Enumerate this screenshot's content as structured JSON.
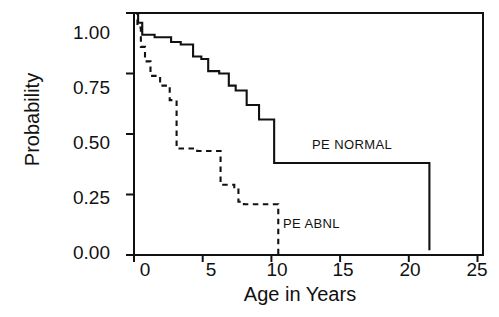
{
  "chart_data": {
    "type": "line",
    "title": "",
    "xlabel": "Age in Years",
    "ylabel": "Probability",
    "xlim": [
      0,
      25.4
    ],
    "ylim": [
      0,
      1.0
    ],
    "xticks": [
      0,
      5,
      10,
      15,
      20,
      25
    ],
    "xtick_labels": [
      "0",
      "5",
      "10",
      "15",
      "20",
      "25"
    ],
    "yticks": [
      0.0,
      0.25,
      0.5,
      0.75,
      1.0
    ],
    "ytick_labels": [
      "0.00",
      "0.25",
      "0.50",
      "0.75",
      "1.00"
    ],
    "grid": false,
    "legend_position": "inline-annotation",
    "step_type": "post",
    "series": [
      {
        "name": "PE NORMAL",
        "style": "solid",
        "color": "#111111",
        "annotation": "PE NORMAL",
        "annotation_x": 13.3,
        "annotation_y": 0.44,
        "x": [
          0.0,
          0.3,
          0.6,
          1.5,
          2.7,
          3.4,
          4.3,
          4.9,
          5.4,
          6.2,
          6.9,
          7.4,
          8.2,
          9.1,
          10.2,
          17.5,
          21.5,
          21.5
        ],
        "y": [
          1.0,
          0.96,
          0.91,
          0.9,
          0.88,
          0.87,
          0.82,
          0.81,
          0.76,
          0.75,
          0.7,
          0.68,
          0.62,
          0.56,
          0.38,
          0.38,
          0.25,
          0.02
        ]
      },
      {
        "name": "PE ABNL",
        "style": "dashed",
        "color": "#111111",
        "annotation": "PE ABNL",
        "annotation_x": 11.2,
        "annotation_y": 0.1,
        "x": [
          0.0,
          0.25,
          0.5,
          0.8,
          1.2,
          1.9,
          2.6,
          3.1,
          3.1,
          4.6,
          6.3,
          6.3,
          7.3,
          7.6,
          8.0,
          10.3,
          10.5
        ],
        "y": [
          1.0,
          0.94,
          0.86,
          0.8,
          0.74,
          0.7,
          0.64,
          0.64,
          0.44,
          0.43,
          0.43,
          0.29,
          0.28,
          0.22,
          0.21,
          0.21,
          0.0
        ]
      }
    ]
  },
  "axes": {
    "xaxis_title": "Age in Years",
    "yaxis_title": "Probability",
    "xtick_labels": [
      "0",
      "5",
      "10",
      "15",
      "20",
      "25"
    ],
    "ytick_labels": [
      "1.00",
      "0.75",
      "0.50",
      "0.25",
      "0.00"
    ]
  },
  "annotations": {
    "pe_normal": "PE NORMAL",
    "pe_abnl": "PE ABNL"
  }
}
